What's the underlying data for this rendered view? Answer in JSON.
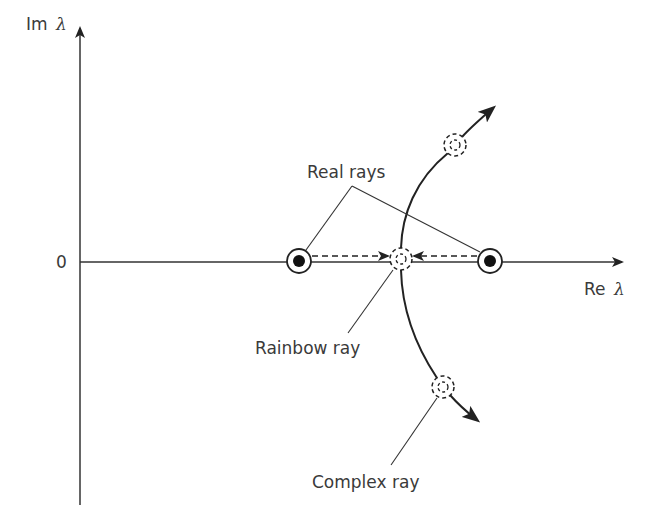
{
  "diagram": {
    "title": "",
    "axes": {
      "y_label_text": "Im",
      "y_label_symbol": "λ",
      "x_label_text": "Re",
      "x_label_symbol": "λ",
      "origin_label": "0"
    },
    "annotations": {
      "real_rays": "Real rays",
      "rainbow_ray": "Rainbow ray",
      "complex_ray": "Complex ray"
    },
    "nodes": [
      {
        "id": "real-ray-left",
        "type": "real",
        "x": 299,
        "y": 261
      },
      {
        "id": "real-ray-right",
        "type": "real",
        "x": 490,
        "y": 261
      },
      {
        "id": "rainbow-ray",
        "type": "rainbow",
        "x": 401,
        "y": 259
      },
      {
        "id": "complex-ray-upper",
        "type": "complex",
        "x": 455,
        "y": 145
      },
      {
        "id": "complex-ray-lower",
        "type": "complex",
        "x": 443,
        "y": 387
      }
    ],
    "colors": {
      "stroke": "#222222",
      "text": "#3a3a3a",
      "background": "#ffffff"
    }
  }
}
